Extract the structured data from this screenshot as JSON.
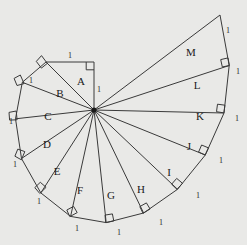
{
  "figure": {
    "name": "spiral-of-theodorus",
    "background_color": "#e9e9e7",
    "stroke_color": "#3a3a3a",
    "label_color": "#1a1a1a",
    "hub": {
      "x": 94,
      "y": 110,
      "label": ""
    },
    "unit_label": "1",
    "triangle_labels": [
      "A",
      "B",
      "C",
      "D",
      "E",
      "F",
      "G",
      "H",
      "I",
      "J",
      "K",
      "L",
      "M"
    ],
    "triangles": [
      {
        "label": "A",
        "label_x": 81,
        "label_y": 82,
        "outer_a": [
          94,
          62
        ],
        "outer_b": [
          94,
          62
        ],
        "has_right_angle": true
      },
      {
        "label": "B",
        "label_x": 60,
        "label_y": 94,
        "has_right_angle": true
      },
      {
        "label": "C",
        "label_x": 48,
        "label_y": 117,
        "has_right_angle": true
      },
      {
        "label": "D",
        "label_x": 47,
        "label_y": 145,
        "has_right_angle": true
      },
      {
        "label": "E",
        "label_x": 57,
        "label_y": 172,
        "has_right_angle": true
      },
      {
        "label": "F",
        "label_x": 80,
        "label_y": 191,
        "has_right_angle": true
      },
      {
        "label": "G",
        "label_x": 111,
        "label_y": 196,
        "has_right_angle": true
      },
      {
        "label": "H",
        "label_x": 141,
        "label_y": 190,
        "has_right_angle": true
      },
      {
        "label": "I",
        "label_x": 169,
        "label_y": 173,
        "has_right_angle": true
      },
      {
        "label": "J",
        "label_x": 189,
        "label_y": 147,
        "has_right_angle": true
      },
      {
        "label": "K",
        "label_x": 200,
        "label_y": 117,
        "has_right_angle": true
      },
      {
        "label": "L",
        "label_x": 197,
        "label_y": 86,
        "has_right_angle": true
      },
      {
        "label": "M",
        "label_x": 191,
        "label_y": 53,
        "has_right_angle": true
      }
    ],
    "unit_labels": [
      {
        "text": "1",
        "x": 70,
        "y": 56
      },
      {
        "text": "1",
        "x": 98,
        "y": 90
      },
      {
        "text": "1",
        "x": 31,
        "y": 81
      },
      {
        "text": "1",
        "x": 12,
        "y": 122
      },
      {
        "text": "1",
        "x": 16,
        "y": 165
      },
      {
        "text": "1",
        "x": 39,
        "y": 202
      },
      {
        "text": "1",
        "x": 77,
        "y": 229
      },
      {
        "text": "1",
        "x": 119,
        "y": 233
      },
      {
        "text": "1",
        "x": 161,
        "y": 223
      },
      {
        "text": "1",
        "x": 198,
        "y": 196
      },
      {
        "text": "1",
        "x": 221,
        "y": 161
      },
      {
        "text": "1",
        "x": 236,
        "y": 119
      },
      {
        "text": "1",
        "x": 237,
        "y": 72
      },
      {
        "text": "1",
        "x": 228,
        "y": 31
      }
    ]
  }
}
